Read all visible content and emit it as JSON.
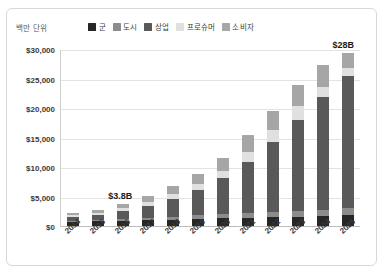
{
  "chart_data": {
    "type": "bar",
    "stacked": true,
    "title": "",
    "subtitle": "",
    "units_label": "백만 단위",
    "xlabel": "",
    "ylabel": "",
    "ylim": [
      0,
      30000
    ],
    "ytick_values": [
      0,
      5000,
      10000,
      15000,
      20000,
      25000,
      30000
    ],
    "ytick_labels": [
      "$0",
      "$5,000",
      "$10,000",
      "$15,000",
      "$20,000",
      "$25,000",
      "$30,000"
    ],
    "grid": true,
    "legend_position": "top",
    "categories": [
      "2014",
      "2015",
      "2016",
      "2017",
      "2018",
      "2019",
      "2020",
      "2021",
      "2022",
      "2023",
      "2024",
      "2025"
    ],
    "series": [
      {
        "name": "군",
        "color": "#262626",
        "values": [
          700,
          800,
          900,
          1000,
          1100,
          1200,
          1300,
          1400,
          1500,
          1600,
          1700,
          1800
        ]
      },
      {
        "name": "도시",
        "color": "#8c8c8c",
        "values": [
          200,
          250,
          300,
          400,
          500,
          600,
          700,
          800,
          900,
          1000,
          1100,
          1200
        ]
      },
      {
        "name": "상업",
        "color": "#595959",
        "values": [
          700,
          900,
          1400,
          2000,
          3000,
          4300,
          6100,
          8600,
          11800,
          15400,
          19000,
          22500
        ]
      },
      {
        "name": "프로슈머",
        "color": "#e0e0e0",
        "values": [
          250,
          300,
          400,
          600,
          800,
          1000,
          1300,
          1700,
          2000,
          2300,
          1700,
          1300
        ]
      },
      {
        "name": "소비자",
        "color": "#a6a6a6",
        "values": [
          350,
          450,
          800,
          1100,
          1400,
          1700,
          2200,
          2900,
          3300,
          3600,
          3800,
          2500
        ]
      }
    ],
    "totals": [
      2200,
      2700,
      3800,
      5100,
      6800,
      8800,
      11600,
      15400,
      19500,
      23900,
      27300,
      29300
    ],
    "annotations": [
      {
        "text": "$3.8B",
        "category": "2016"
      },
      {
        "text": "$28B",
        "category": "2025"
      }
    ]
  }
}
